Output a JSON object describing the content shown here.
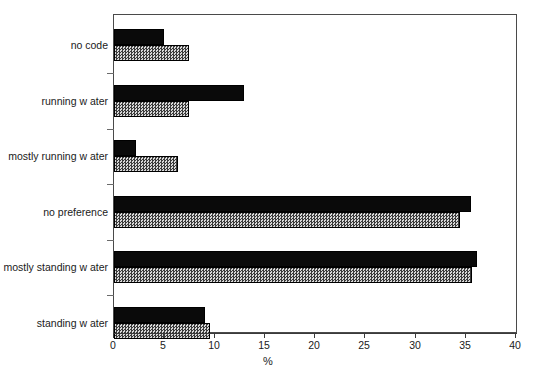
{
  "chart_data": {
    "type": "bar",
    "orientation": "horizontal",
    "title": "",
    "xlabel": "%",
    "ylabel": "",
    "xlim": [
      0,
      40
    ],
    "xticks": [
      0,
      5,
      10,
      15,
      20,
      25,
      30,
      35,
      40
    ],
    "grid": false,
    "legend": "none",
    "categories": [
      "no code",
      "running w ater",
      "mostly running w ater",
      "no preference",
      "mostly standing w ater",
      "standing w ater"
    ],
    "series": [
      {
        "name": "series-a",
        "style": "solid black",
        "color": "#0a0a0a",
        "values": [
          5.0,
          12.9,
          2.2,
          35.5,
          36.1,
          9.1
        ]
      },
      {
        "name": "series-b",
        "style": "gray checker hatch",
        "color": "#9a9a9a",
        "values": [
          7.5,
          7.5,
          6.4,
          34.4,
          35.6,
          9.6
        ]
      }
    ]
  },
  "axis": {
    "x_title": "%",
    "tick_labels": [
      "0",
      "5",
      "10",
      "15",
      "20",
      "25",
      "30",
      "35",
      "40"
    ]
  },
  "caption": {
    "text": ""
  }
}
